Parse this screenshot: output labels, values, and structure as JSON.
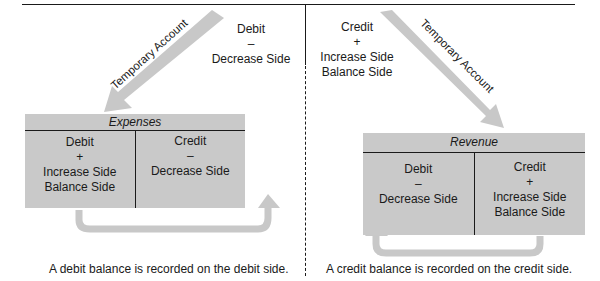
{
  "colors": {
    "account_fill": "#c9c9c9",
    "arrow_fill": "#c8c8c8",
    "line": "#1a1a1a"
  },
  "left": {
    "arrow_label": "Temporary Account",
    "side_note": [
      "Debit",
      "–",
      "Decrease Side"
    ],
    "account": {
      "title": "Expenses",
      "debit": [
        "Debit",
        "+",
        "Increase Side",
        "Balance Side"
      ],
      "credit": [
        "Credit",
        "–",
        "Decrease Side"
      ]
    },
    "caption": "A debit balance is recorded on the debit side."
  },
  "right": {
    "arrow_label": "Temporary Account",
    "side_note": [
      "Credit",
      "+",
      "Increase Side",
      "Balance Side"
    ],
    "account": {
      "title": "Revenue",
      "debit": [
        "Debit",
        "–",
        "Decrease Side"
      ],
      "credit": [
        "Credit",
        "+",
        "Increase Side",
        "Balance Side"
      ]
    },
    "caption": "A credit balance is recorded on the credit side."
  }
}
